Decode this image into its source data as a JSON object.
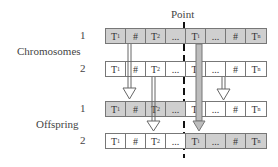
{
  "title": "Point",
  "groups": {
    "chromosomes": {
      "label": "Chromosomes"
    },
    "offspring": {
      "label": "Offspring"
    }
  },
  "rows": [
    {
      "group": "chromosomes",
      "index": "1",
      "cells": [
        {
          "text": "T",
          "sub": "1",
          "shade": "gray"
        },
        {
          "text": "#",
          "sub": "",
          "shade": "gray"
        },
        {
          "text": "T",
          "sub": "2",
          "shade": "gray"
        },
        {
          "text": "...",
          "sub": "",
          "shade": "gray"
        },
        {
          "text": "T",
          "sub": "i",
          "shade": "gray"
        },
        {
          "text": "...",
          "sub": "",
          "shade": "gray"
        },
        {
          "text": "#",
          "sub": "",
          "shade": "gray"
        },
        {
          "text": "T",
          "sub": "n",
          "shade": "gray"
        }
      ]
    },
    {
      "group": "chromosomes",
      "index": "2",
      "cells": [
        {
          "text": "T",
          "sub": "1",
          "shade": "white"
        },
        {
          "text": "#",
          "sub": "",
          "shade": "white"
        },
        {
          "text": "T",
          "sub": "2",
          "shade": "white"
        },
        {
          "text": "...",
          "sub": "",
          "shade": "white"
        },
        {
          "text": "T",
          "sub": "i",
          "shade": "white"
        },
        {
          "text": "...",
          "sub": "",
          "shade": "white"
        },
        {
          "text": "#",
          "sub": "",
          "shade": "white"
        },
        {
          "text": "T",
          "sub": "n",
          "shade": "white"
        }
      ]
    },
    {
      "group": "offspring",
      "index": "1",
      "cells": [
        {
          "text": "T",
          "sub": "1",
          "shade": "gray"
        },
        {
          "text": "#",
          "sub": "",
          "shade": "gray"
        },
        {
          "text": "T",
          "sub": "2",
          "shade": "gray"
        },
        {
          "text": "...",
          "sub": "",
          "shade": "gray"
        },
        {
          "text": "T",
          "sub": "i",
          "shade": "white"
        },
        {
          "text": "...",
          "sub": "",
          "shade": "white"
        },
        {
          "text": "#",
          "sub": "",
          "shade": "white"
        },
        {
          "text": "T",
          "sub": "n",
          "shade": "white"
        }
      ]
    },
    {
      "group": "offspring",
      "index": "2",
      "cells": [
        {
          "text": "T",
          "sub": "1",
          "shade": "white"
        },
        {
          "text": "#",
          "sub": "",
          "shade": "white"
        },
        {
          "text": "T",
          "sub": "2",
          "shade": "white"
        },
        {
          "text": "...",
          "sub": "",
          "shade": "white"
        },
        {
          "text": "T",
          "sub": "i",
          "shade": "gray"
        },
        {
          "text": "...",
          "sub": "",
          "shade": "gray"
        },
        {
          "text": "#",
          "sub": "",
          "shade": "gray"
        },
        {
          "text": "T",
          "sub": "n",
          "shade": "gray"
        }
      ]
    }
  ],
  "colors": {
    "gray_cell": "#cfcfcf",
    "white_cell": "#ffffff",
    "border": "#777777",
    "dash": "#111111"
  }
}
